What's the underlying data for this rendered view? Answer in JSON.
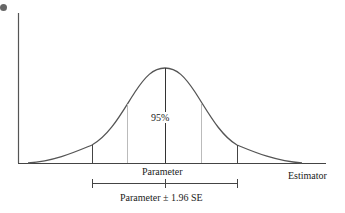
{
  "diagram": {
    "type": "normal-distribution-confidence-interval",
    "labels": {
      "center_percent": "95%",
      "center_axis_label": "Parameter",
      "x_axis_label": "Estimator",
      "interval_label": "Parameter ± 1.96 SE"
    },
    "colors": {
      "curve": "#555555",
      "axis": "#444444",
      "inner_lines": "#bbbbbb",
      "bullet": "#666666"
    }
  }
}
